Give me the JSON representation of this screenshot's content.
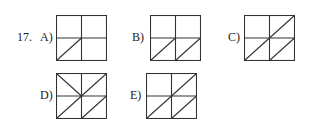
{
  "question": {
    "number": "17.",
    "options": [
      {
        "label": "A)",
        "diagonals": [
          "bl"
        ]
      },
      {
        "label": "B)",
        "diagonals": [
          "bl",
          "br"
        ]
      },
      {
        "label": "C)",
        "diagonals": [
          "bl",
          "tr",
          "br"
        ]
      },
      {
        "label": "D)",
        "diagonals": [
          "tl-anti",
          "tr",
          "bl",
          "br"
        ]
      },
      {
        "label": "E)",
        "diagonals": [
          "bl",
          "tr",
          "br"
        ]
      }
    ]
  }
}
